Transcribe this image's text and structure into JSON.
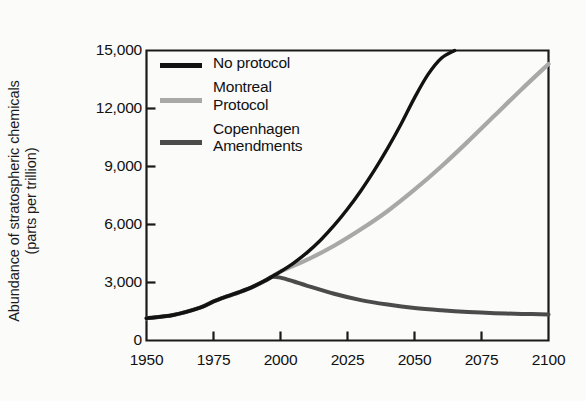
{
  "chart_data": {
    "type": "line",
    "title": "",
    "xlabel": "",
    "ylabel_line1": "Abundance of stratospheric chemicals",
    "ylabel_line2": "(parts per trillion)",
    "xlim": [
      1950,
      2100
    ],
    "ylim": [
      0,
      15000
    ],
    "xticks": [
      1950,
      1975,
      2000,
      2025,
      2050,
      2075,
      2100
    ],
    "xticklabels": [
      "1950",
      "1975",
      "2000",
      "2025",
      "2050",
      "2075",
      "2100"
    ],
    "yticks": [
      0,
      3000,
      6000,
      9000,
      12000,
      15000
    ],
    "yticklabels": [
      "0",
      "3,000",
      "6,000",
      "9,000",
      "12,000",
      "15,000"
    ],
    "grid": false,
    "legend_position": "upper-left-inside",
    "series": [
      {
        "name": "No protocol",
        "color": "#121212",
        "width": 3.4,
        "x": [
          1950,
          1960,
          1970,
          1975,
          1980,
          1985,
          1990,
          1995,
          1998,
          2000,
          2005,
          2010,
          2015,
          2020,
          2025,
          2030,
          2035,
          2040,
          2045,
          2050,
          2055,
          2060,
          2065
        ],
        "y": [
          1150,
          1320,
          1700,
          2020,
          2280,
          2520,
          2800,
          3150,
          3400,
          3560,
          4020,
          4560,
          5200,
          5950,
          6800,
          7750,
          8800,
          9950,
          11200,
          12550,
          13750,
          14600,
          15000
        ]
      },
      {
        "name": "Montreal Protocol",
        "color": "#a8a8a8",
        "width": 4.2,
        "x": [
          1950,
          1960,
          1970,
          1975,
          1980,
          1985,
          1990,
          1995,
          2000,
          2010,
          2020,
          2030,
          2040,
          2050,
          2060,
          2070,
          2080,
          2090,
          2100
        ],
        "y": [
          1150,
          1320,
          1700,
          2020,
          2280,
          2520,
          2800,
          3150,
          3560,
          4180,
          4900,
          5750,
          6700,
          7800,
          9000,
          10300,
          11650,
          13000,
          14300
        ]
      },
      {
        "name": "Copenhagen Amendments",
        "color": "#4b4b4b",
        "width": 4.0,
        "x": [
          1950,
          1960,
          1970,
          1975,
          1980,
          1985,
          1990,
          1995,
          1997,
          2000,
          2005,
          2010,
          2020,
          2030,
          2040,
          2050,
          2060,
          2070,
          2080,
          2090,
          2100
        ],
        "y": [
          1150,
          1320,
          1700,
          2020,
          2280,
          2520,
          2800,
          3150,
          3300,
          3250,
          3050,
          2830,
          2420,
          2090,
          1860,
          1680,
          1560,
          1470,
          1410,
          1375,
          1350
        ]
      }
    ]
  },
  "legend": {
    "entries": [
      {
        "label": "No protocol",
        "color": "#121212",
        "lines": 1
      },
      {
        "label": "Montreal\nProtocol",
        "color": "#a8a8a8",
        "lines": 2
      },
      {
        "label": "Copenhagen\nAmendments",
        "color": "#4b4b4b",
        "lines": 2
      }
    ]
  },
  "axes": {
    "frame_color": "#1a1a1a",
    "tick_color": "#1a1a1a"
  }
}
